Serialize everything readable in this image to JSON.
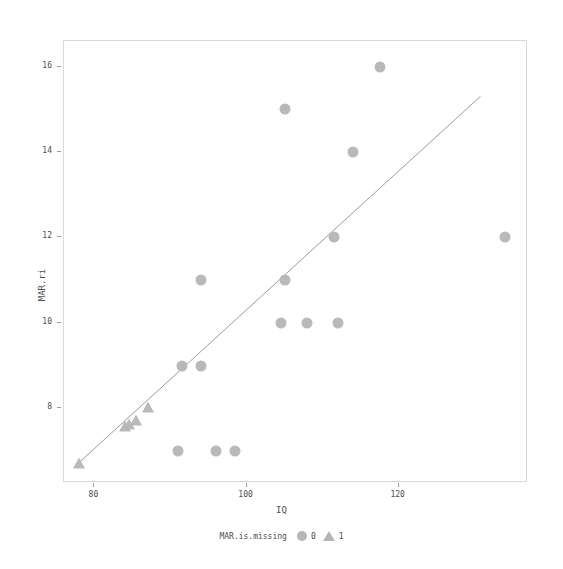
{
  "chart_data": {
    "type": "scatter",
    "title": "",
    "xlabel": "IQ",
    "ylabel": "MAR.ri",
    "xlim": [
      76,
      137
    ],
    "ylim": [
      6.25,
      16.6
    ],
    "xticks": [
      80,
      100,
      120
    ],
    "yticks": [
      8,
      10,
      12,
      14,
      16
    ],
    "grid": false,
    "legend": {
      "title": "MAR.is.missing",
      "position": "bottom",
      "entries": [
        {
          "label": "0",
          "marker": "circle"
        },
        {
          "label": "1",
          "marker": "triangle"
        }
      ]
    },
    "marker_color": "#b5b5b5",
    "line_color": "#9a9a9a",
    "panel_border_color": "#d9d9d9",
    "series": [
      {
        "name": "0",
        "marker": "circle",
        "points": [
          {
            "x": 117.5,
            "y": 16.0
          },
          {
            "x": 105.0,
            "y": 15.0
          },
          {
            "x": 114.0,
            "y": 14.0
          },
          {
            "x": 111.5,
            "y": 12.0
          },
          {
            "x": 134.0,
            "y": 12.0
          },
          {
            "x": 94.0,
            "y": 11.0
          },
          {
            "x": 105.0,
            "y": 11.0
          },
          {
            "x": 104.5,
            "y": 10.0
          },
          {
            "x": 108.0,
            "y": 10.0
          },
          {
            "x": 112.0,
            "y": 10.0
          },
          {
            "x": 91.5,
            "y": 9.0
          },
          {
            "x": 94.0,
            "y": 9.0
          },
          {
            "x": 91.0,
            "y": 7.0
          },
          {
            "x": 96.0,
            "y": 7.0
          },
          {
            "x": 98.5,
            "y": 7.0
          }
        ]
      },
      {
        "name": "1",
        "marker": "triangle",
        "points": [
          {
            "x": 87.0,
            "y": 8.0
          },
          {
            "x": 85.5,
            "y": 7.7
          },
          {
            "x": 84.5,
            "y": 7.6
          },
          {
            "x": 84.0,
            "y": 7.55
          },
          {
            "x": 78.0,
            "y": 6.7
          }
        ]
      }
    ],
    "fit_line": {
      "type": "linear",
      "points": [
        {
          "x": 77.6,
          "y": 6.62
        },
        {
          "x": 131.0,
          "y": 15.3
        }
      ]
    }
  }
}
